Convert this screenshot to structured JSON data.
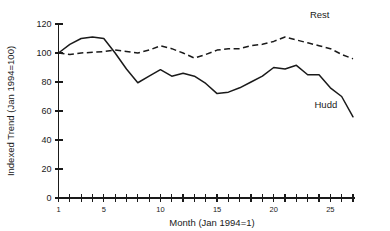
{
  "chart_data": {
    "type": "line",
    "title": "",
    "xlabel": "Month (Jan 1994=1)",
    "ylabel": "Indexed Trend (Jan 1994=100)",
    "xlim": [
      1,
      27
    ],
    "ylim": [
      0,
      120
    ],
    "grid": false,
    "legend_position": "inline-annotation",
    "x": [
      1,
      2,
      3,
      4,
      5,
      6,
      7,
      8,
      9,
      10,
      11,
      12,
      13,
      14,
      15,
      16,
      17,
      18,
      19,
      20,
      21,
      22,
      23,
      24,
      25,
      26,
      27
    ],
    "x_ticks": [
      1,
      2,
      3,
      4,
      5,
      6,
      7,
      8,
      9,
      10,
      11,
      12,
      13,
      14,
      15,
      16,
      17,
      18,
      19,
      20,
      21,
      22,
      23,
      24,
      25,
      26,
      27
    ],
    "x_tick_labels": [
      "1",
      "",
      "",
      "",
      "5",
      "",
      "",
      "",
      "",
      "10",
      "",
      "",
      "",
      "",
      "15",
      "",
      "",
      "",
      "",
      "20",
      "",
      "",
      "",
      "",
      "25",
      "",
      ""
    ],
    "y_ticks": [
      0,
      20,
      40,
      60,
      80,
      100,
      120
    ],
    "y_tick_labels": [
      "0",
      "20",
      "40",
      "60",
      "80",
      "100",
      "120"
    ],
    "series": [
      {
        "name": "Hudd",
        "style": "solid",
        "label_text": "Hudd",
        "label_x": 23.6,
        "label_y": 62,
        "values": [
          100,
          106,
          110,
          111,
          110,
          100,
          89,
          79.5,
          84,
          88.5,
          84,
          86,
          84,
          79,
          72,
          73,
          76,
          80,
          84,
          90,
          89,
          91.5,
          85,
          85,
          76,
          70,
          56
        ]
      },
      {
        "name": "Rest",
        "style": "dashed",
        "label_text": "Rest",
        "label_x": 23.2,
        "label_y": 124,
        "values": [
          100,
          99,
          100,
          100.5,
          101,
          102,
          101,
          100,
          102,
          105,
          103,
          100,
          96.5,
          99,
          102,
          103,
          103,
          105,
          106,
          108,
          111,
          109,
          107,
          105,
          103,
          99,
          96
        ]
      }
    ]
  },
  "axis": {
    "y_axis_title": "Indexed Trend (Jan 1994=100)",
    "x_axis_title": "Month (Jan 1994=1)"
  }
}
